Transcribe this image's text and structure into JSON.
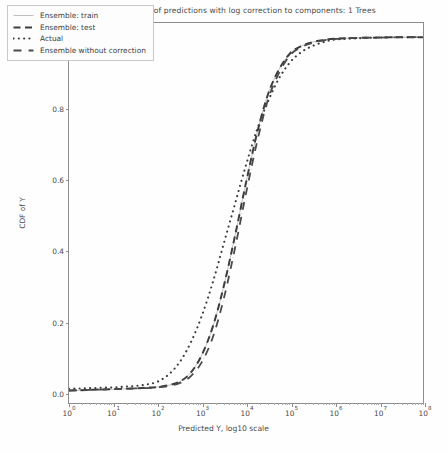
{
  "chart_data": {
    "type": "line",
    "title": "XGBoost Model: CDF of predictions with log correction to components: 1 Trees",
    "xlabel": "Predicted Y, log10 scale",
    "ylabel": "CDF of Y",
    "xscale": "log10",
    "xlim": [
      1,
      100000000
    ],
    "ylim": [
      -0.03,
      1.04
    ],
    "grid": false,
    "legend_position": "upper-left",
    "xticks": [
      {
        "label": "10",
        "exponent": "0",
        "value": 1
      },
      {
        "label": "10",
        "exponent": "1",
        "value": 10
      },
      {
        "label": "10",
        "exponent": "2",
        "value": 100
      },
      {
        "label": "10",
        "exponent": "3",
        "value": 1000
      },
      {
        "label": "10",
        "exponent": "4",
        "value": 10000
      },
      {
        "label": "10",
        "exponent": "5",
        "value": 100000
      },
      {
        "label": "10",
        "exponent": "6",
        "value": 1000000
      },
      {
        "label": "10",
        "exponent": "7",
        "value": 10000000
      },
      {
        "label": "10",
        "exponent": "8",
        "value": 100000000
      }
    ],
    "yticks": [
      {
        "label": "0.0",
        "value": 0.0
      },
      {
        "label": "0.2",
        "value": 0.2
      },
      {
        "label": "0.4",
        "value": 0.4
      },
      {
        "label": "0.6",
        "value": 0.6
      },
      {
        "label": "0.8",
        "value": 0.8
      },
      {
        "label": "1.0",
        "value": 1.0
      }
    ],
    "x_log10": [
      0.0,
      0.25,
      0.5,
      0.75,
      1.0,
      1.25,
      1.5,
      1.75,
      2.0,
      2.25,
      2.5,
      2.75,
      3.0,
      3.25,
      3.5,
      3.75,
      4.0,
      4.25,
      4.5,
      4.75,
      5.0,
      5.25,
      5.5,
      5.75,
      6.0,
      6.5,
      7.0,
      7.5,
      8.0
    ],
    "series": [
      {
        "name": "Ensemble: train",
        "style": "solid-thin",
        "color": "#b9b9b9",
        "width": 0.9,
        "values": [
          0.005,
          0.006,
          0.007,
          0.008,
          0.009,
          0.01,
          0.011,
          0.013,
          0.015,
          0.02,
          0.03,
          0.055,
          0.105,
          0.185,
          0.3,
          0.44,
          0.59,
          0.73,
          0.84,
          0.91,
          0.955,
          0.975,
          0.986,
          0.992,
          0.996,
          0.998,
          0.999,
          1.0,
          1.0
        ]
      },
      {
        "name": "Ensemble: test",
        "style": "dashed",
        "color": "#3d3d3d",
        "width": 2.0,
        "values": [
          0.005,
          0.006,
          0.007,
          0.008,
          0.009,
          0.01,
          0.011,
          0.013,
          0.015,
          0.02,
          0.03,
          0.055,
          0.105,
          0.185,
          0.3,
          0.44,
          0.59,
          0.73,
          0.84,
          0.91,
          0.955,
          0.975,
          0.986,
          0.992,
          0.996,
          0.998,
          0.999,
          1.0,
          1.0
        ]
      },
      {
        "name": "Actual",
        "style": "dotted",
        "color": "#3d3d3d",
        "width": 2.1,
        "values": [
          0.01,
          0.011,
          0.012,
          0.013,
          0.014,
          0.016,
          0.018,
          0.022,
          0.03,
          0.05,
          0.085,
          0.14,
          0.215,
          0.31,
          0.42,
          0.53,
          0.64,
          0.74,
          0.82,
          0.885,
          0.93,
          0.958,
          0.975,
          0.986,
          0.993,
          0.997,
          0.999,
          1.0,
          1.0
        ]
      },
      {
        "name": "Ensemble without correction",
        "style": "dashdot",
        "color": "#4a4a4a",
        "width": 1.8,
        "values": [
          0.005,
          0.006,
          0.007,
          0.008,
          0.009,
          0.01,
          0.011,
          0.012,
          0.014,
          0.018,
          0.026,
          0.045,
          0.085,
          0.155,
          0.265,
          0.405,
          0.56,
          0.705,
          0.825,
          0.9,
          0.95,
          0.972,
          0.984,
          0.991,
          0.995,
          0.998,
          0.999,
          1.0,
          1.0
        ]
      }
    ],
    "legend": [
      {
        "label": "Ensemble: train",
        "swatch": "solid-thin"
      },
      {
        "label": "Ensemble: test",
        "swatch": "dashed"
      },
      {
        "label": "Actual",
        "swatch": "dotted"
      },
      {
        "label": "Ensemble without correction",
        "swatch": "dashdot"
      }
    ]
  }
}
